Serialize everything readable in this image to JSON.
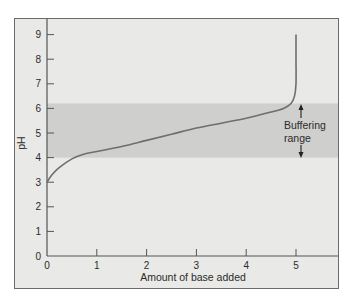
{
  "chart_data": {
    "type": "line",
    "title": "",
    "xlabel": "Amount of base added",
    "ylabel": "pH",
    "xlim": [
      0,
      5.9
    ],
    "ylim": [
      0,
      9.2
    ],
    "x_ticks": [
      0,
      1,
      2,
      3,
      4,
      5
    ],
    "y_ticks": [
      0,
      1,
      2,
      3,
      4,
      5,
      6,
      7,
      8,
      9
    ],
    "grid": false,
    "legend": null,
    "series": [
      {
        "name": "Titration curve",
        "x": [
          0,
          0.1,
          0.25,
          0.5,
          0.75,
          1,
          1.5,
          2,
          2.5,
          3,
          3.5,
          4,
          4.5,
          4.75,
          4.9,
          4.97,
          5,
          5,
          5
        ],
        "y": [
          3.0,
          3.3,
          3.6,
          3.95,
          4.15,
          4.25,
          4.45,
          4.7,
          4.95,
          5.2,
          5.4,
          5.6,
          5.85,
          6.0,
          6.2,
          6.5,
          7.0,
          8.0,
          9.0
        ],
        "color": "#6e6e6e"
      }
    ],
    "shaded_region": {
      "y_from": 4.0,
      "y_to": 6.2,
      "color": "#cfcfcd",
      "label": "Buffering range"
    },
    "annotations": [
      {
        "text": "Buffering",
        "x": 5.1,
        "y": 5.25
      },
      {
        "text": "range",
        "x": 5.1,
        "y": 4.75
      }
    ]
  },
  "labels": {
    "xlabel": "Amount of base added",
    "ylabel": "pH",
    "annot_line1": "Buffering",
    "annot_line2": "range",
    "x_ticks": [
      "0",
      "1",
      "2",
      "3",
      "4",
      "5"
    ],
    "y_ticks": [
      "0",
      "1",
      "2",
      "3",
      "4",
      "5",
      "6",
      "7",
      "8",
      "9"
    ]
  },
  "colors": {
    "background": "#e9e9e7",
    "band": "#cfcfcd",
    "curve": "#6e6e6e",
    "axis": "#555555",
    "text": "#2b2b2b"
  }
}
